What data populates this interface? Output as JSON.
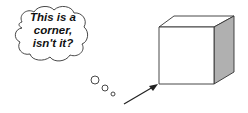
{
  "thought_bubble": {
    "lines": [
      "This is a",
      "corner,",
      "isn't it?"
    ]
  },
  "icons": {
    "cube": "cube-icon",
    "arrow": "arrow-icon",
    "bubble": "thought-cloud-icon"
  },
  "colors": {
    "stroke": "#222222",
    "cube_side": "#b0b0b0",
    "background": "#ffffff"
  }
}
